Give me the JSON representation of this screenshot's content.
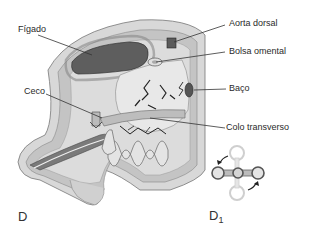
{
  "figure": {
    "colors": {
      "background": "#ffffff",
      "wall_outer": "#d6d6d6",
      "wall_mid": "#bdbdbd",
      "cavity": "#c9c9c9",
      "organ_dark": "#5a5a5a",
      "organ_mid": "#a8a8a8",
      "organ_light": "#e2e2e2",
      "line": "#333333",
      "vessel": "#222222"
    },
    "labels": {
      "figado": "Fígado",
      "ceco": "Ceco",
      "aorta_dorsal": "Aorta dorsal",
      "bolsa_omental": "Bolsa omental",
      "baco": "Baço",
      "colo_transverso": "Colo transverso"
    },
    "panels": {
      "main": "D",
      "inset_letter": "D",
      "inset_sub": "1"
    }
  }
}
